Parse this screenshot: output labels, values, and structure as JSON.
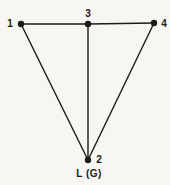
{
  "figure": {
    "caption": "L (G)",
    "colors": {
      "background": "#f7f6f3",
      "ink": "#1c1b19"
    },
    "canvas": {
      "width": 170,
      "height": 185
    },
    "node_radius": 3.2,
    "edge_width": 1.4,
    "graph": {
      "nodes": [
        {
          "id": "1",
          "label": "1",
          "x": 21,
          "y": 24,
          "label_x": 10,
          "label_y": 27,
          "anchor": "middle"
        },
        {
          "id": "3",
          "label": "3",
          "x": 88,
          "y": 24,
          "label_x": 88,
          "label_y": 17,
          "anchor": "middle"
        },
        {
          "id": "4",
          "label": "4",
          "x": 154,
          "y": 23,
          "label_x": 164,
          "label_y": 27,
          "anchor": "middle"
        },
        {
          "id": "2",
          "label": "2",
          "x": 88,
          "y": 160,
          "label_x": 99,
          "label_y": 163,
          "anchor": "middle"
        }
      ],
      "edges": [
        {
          "from": "1",
          "to": "3"
        },
        {
          "from": "3",
          "to": "4"
        },
        {
          "from": "1",
          "to": "2"
        },
        {
          "from": "3",
          "to": "2"
        },
        {
          "from": "4",
          "to": "2"
        }
      ]
    }
  }
}
